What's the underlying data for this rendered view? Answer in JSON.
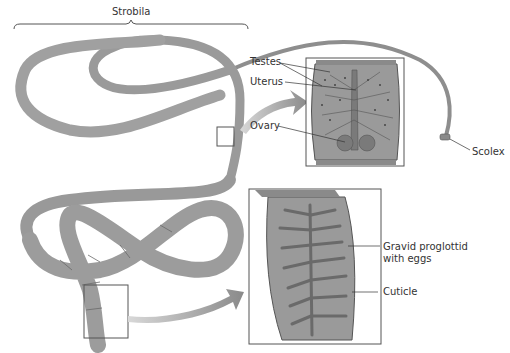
{
  "diagram": {
    "title_bracket_label": "Strobila",
    "labels": {
      "testes": "Testes",
      "uterus": "Uterus",
      "ovary": "Ovary",
      "scolex": "Scolex",
      "gravid_line1": "Gravid proglottid",
      "gravid_line2": "with eggs",
      "cuticle": "Cuticle"
    },
    "colors": {
      "body": "#9a9a9a",
      "body_dark": "#7a7a7a",
      "body_light": "#b8b8b8",
      "organ": "#6f6f6f",
      "outline": "#555555"
    }
  }
}
